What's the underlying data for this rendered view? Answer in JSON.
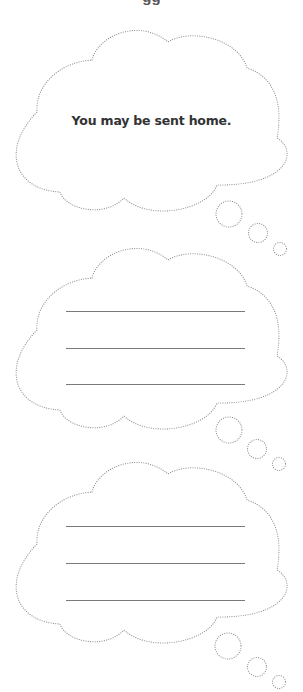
{
  "page": {
    "clipped_top_text": "gg"
  },
  "bubbles": [
    {
      "id": "bubble-1",
      "type": "thought-cloud",
      "offset_y": 0,
      "text": "You may be sent home.",
      "lines": []
    },
    {
      "id": "bubble-2",
      "type": "thought-cloud",
      "offset_y": 218,
      "text": "",
      "lines": [
        93,
        130,
        166
      ]
    },
    {
      "id": "bubble-3",
      "type": "thought-cloud",
      "offset_y": 432,
      "text": "",
      "lines": [
        94,
        131,
        168
      ]
    }
  ],
  "colors": {
    "outline": "#8a8a8a",
    "text": "#333333",
    "lines": "#7a7a7a",
    "background": "#ffffff"
  }
}
